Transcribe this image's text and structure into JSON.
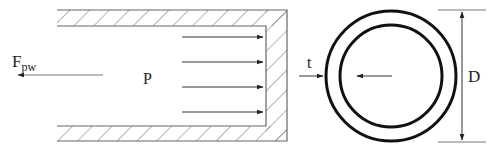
{
  "diagram": {
    "labels": {
      "force": "F",
      "force_subscript": "pw",
      "pressure": "P",
      "thickness": "t",
      "diameter": "D"
    },
    "colors": {
      "line": "#555555",
      "hatch": "#666666",
      "circle": "#111111",
      "text": "#222222",
      "background": "#ffffff"
    },
    "pressure_arrow_count": 4
  }
}
